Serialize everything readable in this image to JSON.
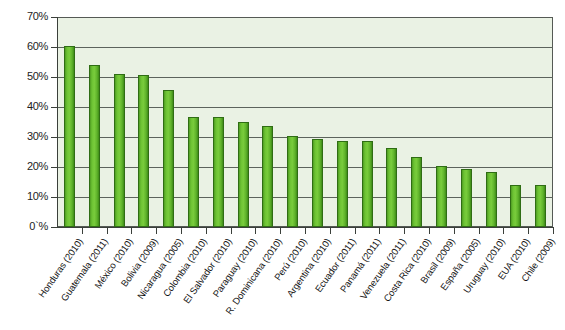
{
  "chart_data": {
    "type": "bar",
    "title": "",
    "subtitle": "",
    "xlabel": "",
    "ylabel": "",
    "ylim": [
      0,
      70
    ],
    "ytick_values": [
      0,
      10,
      20,
      30,
      40,
      50,
      60,
      70
    ],
    "ytick_labels": [
      "0`%",
      "10%",
      "20%",
      "30%",
      "40%",
      "50%",
      "60%",
      "70%"
    ],
    "grid": true,
    "legend": null,
    "bar_color": "#6cc233",
    "bar_edge_color": "#2f6d14",
    "plot_background": "#eaf2e4",
    "categories": [
      "Honduras (2010)",
      "Guatemala (2011)",
      "México (2010)",
      "Bolivia (2009)",
      "Nicaragua (2005)",
      "Colombia (2010)",
      "El Salvador (2010)",
      "Paraguay (2010)",
      "R. Dominicana (2010)",
      "Perú (2010)",
      "Argentina (2010)",
      "Ecuador (2011)",
      "Panamá (2011)",
      "Venezuela (2011)",
      "Costa Rica (2010)",
      "Brasil (2009)",
      "España (2005)",
      "Uruguay (2010)",
      "EUA (2010)",
      "Chile (2009)"
    ],
    "values": [
      60.2,
      54.0,
      51.0,
      50.8,
      45.8,
      36.8,
      36.8,
      35.0,
      33.8,
      30.5,
      29.2,
      28.8,
      28.6,
      26.2,
      23.5,
      20.5,
      19.3,
      18.5,
      14.0,
      14.0
    ]
  }
}
